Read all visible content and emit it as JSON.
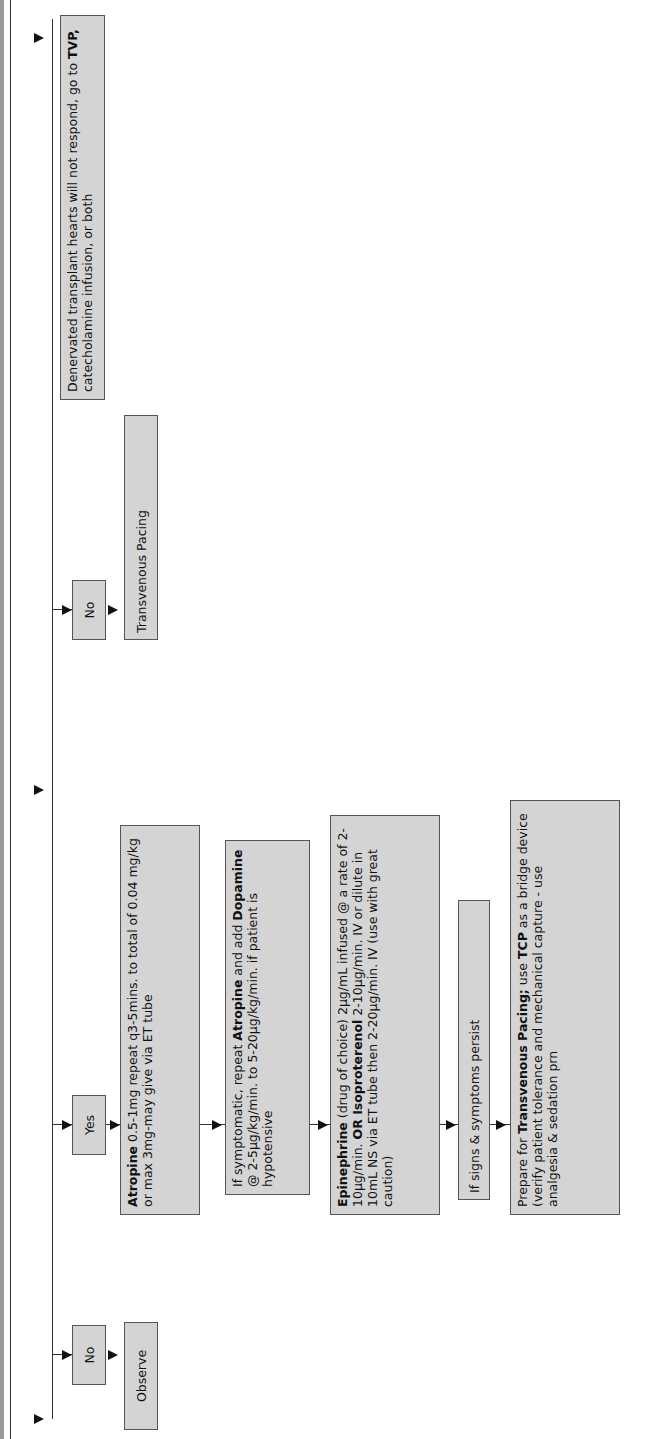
{
  "header": {
    "bar_color": "#9a9a9a",
    "rule_color": "#333333"
  },
  "branches": {
    "no_left": {
      "label": "No",
      "outcome": "Observe"
    },
    "yes": {
      "label": "Yes"
    },
    "no_mid": {
      "label": "No",
      "outcome": "Transvenous Pacing"
    }
  },
  "yes_steps": [
    {
      "bold": "Atropine",
      "text": " 0.5-1mg repeat q3-5mins. to total of 0.04 mg/kg or max 3mg-may give via ET tube"
    },
    {
      "pre": "If symptomatic, repeat ",
      "bold1": "Atropine",
      "mid": " and add ",
      "bold2": "Dopamine",
      "text": " @ 2-5µg/kg/min. to 5-20µg/kg/min. if patient is hypotensive"
    },
    {
      "bold": "Epinephrine",
      "text": " (drug of choice) 2µg/mL infused @ a rate of 2-10µg/min. ",
      "bold2": "OR Isoproterenol",
      "text2": " 2-10µg/min. IV or dilute in 10mL NS via ET tube then 2-20µg/min. IV (use with great caution)"
    },
    {
      "text": "If signs & symptoms persist"
    },
    {
      "pre": "Prepare for ",
      "bold1": "Transvenous Pacing;",
      "mid": " use ",
      "bold2": "TCP",
      "text": " as a bridge device (verify patient tolerance and mechanical capture - use analgesia & sedation prn"
    }
  ],
  "note": {
    "text": "Denervated transplant hearts will not respond, go to ",
    "bold": "TVP,",
    "text2": " catecholamine infusion, or both"
  },
  "colors": {
    "box_fill": "#d4d4d4",
    "box_border": "#555555",
    "line": "#333333"
  }
}
